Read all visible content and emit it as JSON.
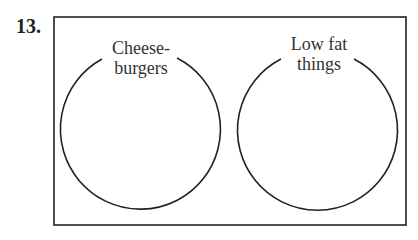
{
  "problem": {
    "number": "13."
  },
  "venn": {
    "circles": [
      {
        "label_line1": "Cheese-",
        "label_line2": "burgers"
      },
      {
        "label_line1": "Low fat",
        "label_line2": "things"
      }
    ]
  }
}
